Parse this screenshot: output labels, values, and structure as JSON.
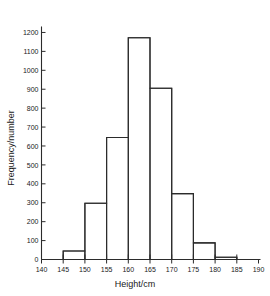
{
  "chart_data": {
    "type": "bar",
    "title": "",
    "subtitle": "",
    "xlabel": "Height/cm",
    "ylabel": "Frequency/number",
    "xlim": [
      140,
      190
    ],
    "ylim": [
      0,
      1250
    ],
    "grid": false,
    "legend": null,
    "bin_width": 5,
    "bin_edges": [
      140,
      145,
      150,
      155,
      160,
      165,
      170,
      175,
      180,
      185,
      190
    ],
    "categories": [
      "140-145",
      "145-150",
      "150-155",
      "155-160",
      "160-165",
      "165-170",
      "170-175",
      "175-180",
      "180-185",
      "185-190"
    ],
    "values": [
      0,
      45,
      297,
      645,
      1172,
      905,
      348,
      88,
      12,
      0
    ],
    "xticks": [
      140,
      145,
      150,
      155,
      160,
      165,
      170,
      175,
      180,
      185,
      190
    ],
    "xtick_labels": [
      "140",
      "145",
      "150",
      "155",
      "160",
      "165",
      "170",
      "175",
      "180",
      "185",
      "190"
    ],
    "yticks": [
      0,
      100,
      200,
      300,
      400,
      500,
      600,
      700,
      800,
      900,
      1000,
      1100,
      1200
    ],
    "ytick_labels": [
      "0",
      "100",
      "200",
      "300",
      "400",
      "500",
      "600",
      "700",
      "800",
      "900",
      "1000",
      "1100",
      "1200"
    ],
    "colors": {
      "line": "#2b2b2b",
      "fill": "#ffffff",
      "background": "#ffffff",
      "text": "#1a1a1a"
    }
  }
}
